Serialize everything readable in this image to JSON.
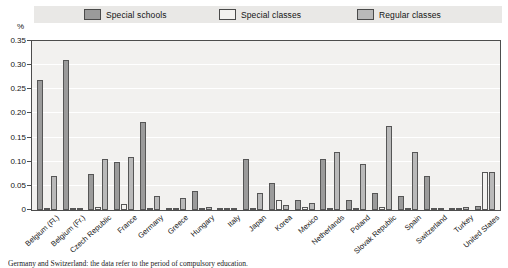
{
  "legend": {
    "items": [
      {
        "label": "Special schools",
        "key": "special_schools",
        "color": "#9b9b9b"
      },
      {
        "label": "Special classes",
        "key": "special_classes",
        "color": "#f3f2f0"
      },
      {
        "label": "Regular classes",
        "key": "regular_classes",
        "color": "#b9b9b9"
      }
    ]
  },
  "axis": {
    "unit": "%",
    "ticks": [
      "0.35",
      "0.30",
      "0.25",
      "0.20",
      "0.15",
      "0.10",
      "0.05",
      "0"
    ]
  },
  "footnote": {
    "text": "Germany and Switzerland: the data refer to the period of compulsory education."
  },
  "chart_data": {
    "type": "bar",
    "title": "",
    "xlabel": "",
    "ylabel": "%",
    "ylim": [
      0,
      0.35
    ],
    "ytick_step": 0.05,
    "grid": true,
    "legend_position": "top",
    "categories": [
      "Belgium (Fl.)",
      "Belgium (Fr.)",
      "Czech Republic",
      "France",
      "Germany",
      "Greece",
      "Hungary",
      "Italy",
      "Japan",
      "Korea",
      "Mexico",
      "Netherlands",
      "Poland",
      "Slovak Republic",
      "Spain",
      "Switzerland",
      "Turkey",
      "United States"
    ],
    "series": [
      {
        "name": "Special schools",
        "color": "#9b9b9b",
        "values": [
          0.27,
          0.31,
          0.075,
          0.1,
          0.182,
          0.005,
          0.04,
          0.002,
          0.105,
          0.055,
          0.02,
          0.105,
          0.02,
          0.035,
          0.03,
          0.07,
          0.003,
          0.008
        ]
      },
      {
        "name": "Special classes",
        "color": "#f3f2f0",
        "values": [
          0.004,
          0.003,
          0.006,
          0.013,
          0.003,
          0.002,
          0.004,
          0.001,
          0.004,
          0.02,
          0.006,
          0.004,
          0.005,
          0.006,
          0.004,
          0.004,
          0.002,
          0.078
        ]
      },
      {
        "name": "Regular classes",
        "color": "#b9b9b9",
        "values": [
          0.07,
          0.004,
          0.105,
          0.11,
          0.03,
          0.025,
          0.006,
          0.002,
          0.035,
          0.011,
          0.015,
          0.12,
          0.095,
          0.175,
          0.12,
          0.004,
          0.006,
          0.078
        ]
      }
    ]
  }
}
